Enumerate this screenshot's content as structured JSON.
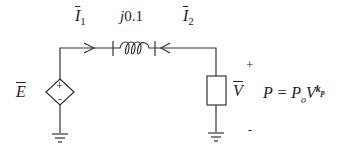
{
  "diagram": {
    "type": "circuit",
    "labels": {
      "source": "E",
      "current_left": "I",
      "current_left_sub": "1",
      "impedance": "j0.1",
      "current_right": "I",
      "current_right_sub": "2",
      "load_voltage": "V",
      "plus": "+",
      "minus": "-",
      "equation_lhs": "P = P",
      "equation_sub": "o",
      "equation_base": "V",
      "equation_exp": "k",
      "equation_exp_sub": "p"
    },
    "components": [
      {
        "id": "dependent-voltage-source",
        "symbol": "diamond",
        "polarity": [
          "+",
          "-"
        ]
      },
      {
        "id": "inductor",
        "value": "j0.1"
      },
      {
        "id": "load",
        "symbol": "rectangle"
      },
      {
        "id": "ground-left"
      },
      {
        "id": "ground-right"
      }
    ],
    "colors": {
      "stroke": "#333333",
      "background": "#ffffff"
    }
  }
}
